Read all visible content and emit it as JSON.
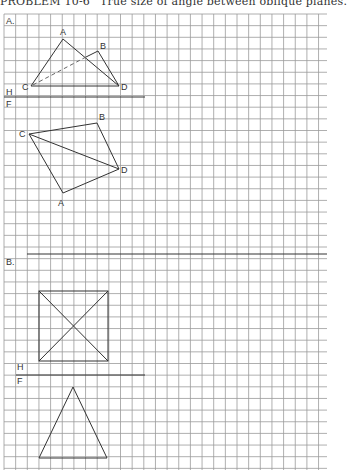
{
  "title": {
    "problem": "PROBLEM 10-6",
    "text": "True size of angle between oblique planes."
  },
  "sections": [
    {
      "id": "A",
      "label": "A.",
      "fold_labels": {
        "top": "H",
        "bottom": "F"
      },
      "top_view": {
        "points": [
          {
            "name": "A",
            "label": "A"
          },
          {
            "name": "B",
            "label": "B"
          },
          {
            "name": "C",
            "label": "C"
          },
          {
            "name": "D",
            "label": "D"
          }
        ],
        "edges": [
          [
            "C",
            "A",
            "solid"
          ],
          [
            "A",
            "D",
            "solid"
          ],
          [
            "D",
            "B",
            "solid"
          ],
          [
            "C",
            "D",
            "solid"
          ],
          [
            "B",
            "C",
            "hidden"
          ]
        ]
      },
      "front_view": {
        "points": [
          {
            "name": "A",
            "label": "A"
          },
          {
            "name": "B",
            "label": "B"
          },
          {
            "name": "C",
            "label": "C"
          },
          {
            "name": "D",
            "label": "D"
          }
        ],
        "edges": [
          [
            "C",
            "B",
            "solid"
          ],
          [
            "B",
            "D",
            "solid"
          ],
          [
            "C",
            "D",
            "solid"
          ],
          [
            "C",
            "A",
            "solid"
          ],
          [
            "A",
            "D",
            "solid"
          ]
        ]
      }
    },
    {
      "id": "B",
      "label": "B.",
      "fold_labels": {
        "top": "H",
        "bottom": "F"
      },
      "top_view": {
        "shape": "square-pyramid-top",
        "description": "square with diagonals"
      },
      "front_view": {
        "shape": "triangle"
      }
    }
  ],
  "colors": {
    "grid": "#9a9a9a",
    "line": "#333333",
    "background": "#ffffff"
  }
}
